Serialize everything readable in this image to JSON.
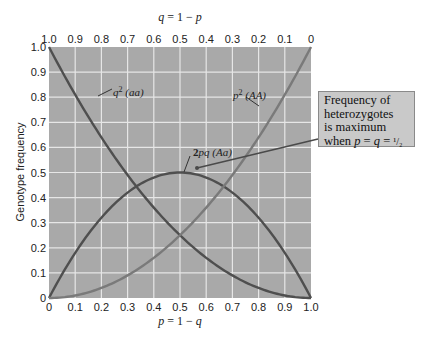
{
  "chart_data": {
    "type": "line",
    "title": "",
    "xlabel": "p = 1 − q",
    "xlabel_top": "q = 1 − p",
    "ylabel": "Genotype frequency",
    "xlim": [
      0,
      1
    ],
    "ylim": [
      0,
      1
    ],
    "grid": true,
    "x_ticks": [
      "0",
      "0.1",
      "0.2",
      "0.3",
      "0.4",
      "0.5",
      "0.6",
      "0.7",
      "0.8",
      "0.9",
      "1.0"
    ],
    "x_ticks_top": [
      "1.0",
      "0.9",
      "0.8",
      "0.7",
      "0.6",
      "0.5",
      "0.4",
      "0.3",
      "0.2",
      "0.1",
      "0"
    ],
    "y_ticks": [
      "0",
      "0.1",
      "0.2",
      "0.3",
      "0.4",
      "0.5",
      "0.6",
      "0.7",
      "0.8",
      "0.9",
      "1.0"
    ],
    "x": [
      0,
      0.1,
      0.2,
      0.3,
      0.4,
      0.5,
      0.6,
      0.7,
      0.8,
      0.9,
      1.0
    ],
    "series": [
      {
        "name": "q² (aa)",
        "values": [
          1.0,
          0.81,
          0.64,
          0.49,
          0.36,
          0.25,
          0.16,
          0.09,
          0.04,
          0.01,
          0.0
        ]
      },
      {
        "name": "2pq (Aa)",
        "values": [
          0.0,
          0.18,
          0.32,
          0.42,
          0.48,
          0.5,
          0.48,
          0.42,
          0.32,
          0.18,
          0.0
        ]
      },
      {
        "name": "p² (AA)",
        "values": [
          0.0,
          0.01,
          0.04,
          0.09,
          0.16,
          0.25,
          0.36,
          0.49,
          0.64,
          0.81,
          1.0
        ]
      }
    ],
    "annotations": [
      {
        "text": "Frequency of heterozygotes is maximum when p = q = 1/2",
        "points_to": [
          0.5,
          0.5
        ]
      }
    ],
    "colors": {
      "plot_background": "#a9a9a9",
      "grid": "#e6e6e6",
      "q2_curve": "#4f4f4f",
      "het_curve": "#4f4f4f",
      "p2_curve": "#7a7a7a",
      "callout_background": "#c9c9c9"
    }
  },
  "labels": {
    "top_axis_title": "q = 1 − p",
    "bottom_axis_title": "p = 1 − q",
    "y_axis_title": "Genotype frequency",
    "q2": {
      "sym": "q",
      "sup": "2",
      "geno": "(aa)"
    },
    "p2": {
      "sym": "p",
      "sup": "2",
      "geno": "(AA)"
    },
    "het": {
      "sym": "2pq",
      "geno": "(Aa)"
    }
  },
  "callout": {
    "lines": [
      "Frequency of",
      "heterozygotes",
      "is maximum",
      "when p = q = ½"
    ]
  }
}
